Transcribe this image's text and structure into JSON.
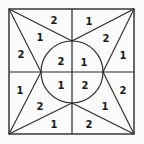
{
  "puzzle": {
    "background_color": "#fbfbfb",
    "line_color": "#2a2a2a",
    "outer_square": {
      "x1": 9,
      "y1": 9,
      "x2": 134,
      "y2": 134
    },
    "center": {
      "x": 72,
      "y": 72
    },
    "circle_radius": 31,
    "labels": [
      {
        "id": "tl-top",
        "value": "2",
        "x": 54,
        "y": 20
      },
      {
        "id": "tl-mid",
        "value": "1",
        "x": 40,
        "y": 37
      },
      {
        "id": "tl-left",
        "value": "2",
        "x": 21,
        "y": 54
      },
      {
        "id": "tl-inner",
        "value": "2",
        "x": 61,
        "y": 61
      },
      {
        "id": "tr-top",
        "value": "1",
        "x": 89,
        "y": 21
      },
      {
        "id": "tr-mid",
        "value": "2",
        "x": 106,
        "y": 38
      },
      {
        "id": "tr-right",
        "value": "1",
        "x": 123,
        "y": 55
      },
      {
        "id": "tr-inner",
        "value": "1",
        "x": 84,
        "y": 62
      },
      {
        "id": "bl-left",
        "value": "1",
        "x": 20,
        "y": 90
      },
      {
        "id": "bl-mid",
        "value": "2",
        "x": 40,
        "y": 106
      },
      {
        "id": "bl-bottom",
        "value": "1",
        "x": 54,
        "y": 124
      },
      {
        "id": "bl-inner",
        "value": "1",
        "x": 61,
        "y": 85
      },
      {
        "id": "br-inner",
        "value": "2",
        "x": 85,
        "y": 85
      },
      {
        "id": "br-mid",
        "value": "1",
        "x": 105,
        "y": 106
      },
      {
        "id": "br-right",
        "value": "2",
        "x": 123,
        "y": 90
      },
      {
        "id": "br-bottom",
        "value": "2",
        "x": 89,
        "y": 124
      }
    ]
  }
}
